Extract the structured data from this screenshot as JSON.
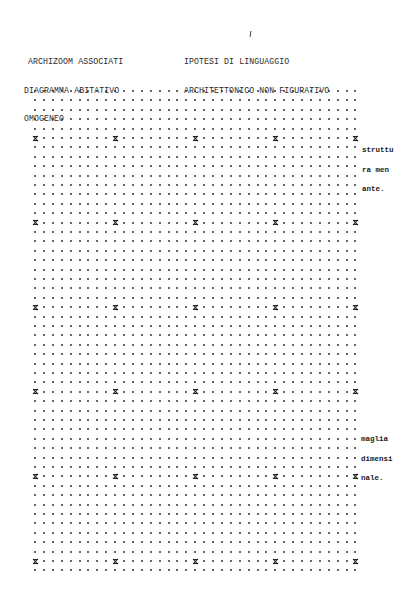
{
  "header": {
    "left": {
      "line1": "ARCHIZOOM ASSOCIATI",
      "line2": "DIAGRAMMA ABITATIVO",
      "line3": "OMOGENEO"
    },
    "right": {
      "line1": "IPOTESI DI LINGUAGGIO",
      "line2": "ARCHITETTONICO NON FIGURATIVO"
    }
  },
  "grid": {
    "columns": 37,
    "rows": 52,
    "origin_x": 35,
    "origin_y": 91,
    "col_spacing": 8.9,
    "row_spacing": 9.4,
    "marker_rows": [
      5,
      14,
      23,
      32,
      41,
      50
    ],
    "marker_cols": [
      0,
      9,
      18,
      27,
      36
    ],
    "dot_symbol": "dot",
    "marker_symbol": "x-mark"
  },
  "annotations": [
    {
      "line1": "struttu",
      "line2": "ra men",
      "line3": "ante."
    },
    {
      "line1": "maglia",
      "line2": "dimensi",
      "line3": "nale."
    }
  ]
}
